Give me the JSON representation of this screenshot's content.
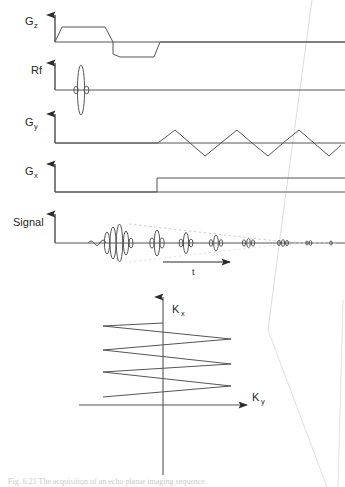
{
  "figure": {
    "kind": "mri-pulse-sequence-diagram",
    "ink_color": "#333333",
    "faint_color": "#cccccc",
    "background": "#ffffff"
  },
  "pulse_sequence": {
    "channels": [
      {
        "id": "gz",
        "label": "G",
        "subscript": "z",
        "name": "slice-select-gradient",
        "waveform": "positive trapezoid lobe followed by negative rephasing trapezoid lobe"
      },
      {
        "id": "rf",
        "label": "Rf",
        "subscript": "",
        "name": "radiofrequency-excitation",
        "waveform": "single sinc-shaped excitation pulse with small side lobes"
      },
      {
        "id": "gy",
        "label": "G",
        "subscript": "y",
        "name": "phase-encode-gradient",
        "waveform": "continuous oscillating triangular wave, four positive and four negative lobes"
      },
      {
        "id": "gx",
        "label": "G",
        "subscript": "x",
        "name": "readout-gradient",
        "waveform": "long constant rectangular plateau spanning the readout period"
      },
      {
        "id": "signal",
        "label": "Signal",
        "subscript": "",
        "name": "acquired-signal",
        "waveform": "train of gradient echoes of decreasing amplitude under a dashed T2* decay envelope"
      }
    ],
    "time_axis": {
      "label": "t",
      "name": "time-axis-arrow"
    },
    "echo_train": {
      "count": 8,
      "relative_amplitudes": [
        1.0,
        0.62,
        0.46,
        0.33,
        0.2,
        0.13,
        0.07,
        0.04
      ],
      "envelope": "dashed decaying curve"
    }
  },
  "kspace": {
    "title": "k-space trajectory",
    "x_axis_label": "K",
    "x_axis_subscript": "y",
    "y_axis_label": "K",
    "y_axis_subscript": "x",
    "trajectory": "zigzag raster sweeping back and forth in Ky while stepping upward in Kx",
    "lines": 4,
    "name": "kspace-zigzag-trajectory"
  },
  "caption": {
    "text": "Fig. 6.21   The acquisition of an echo planar imaging sequence",
    "visible": "partially cropped at the bottom edge"
  }
}
